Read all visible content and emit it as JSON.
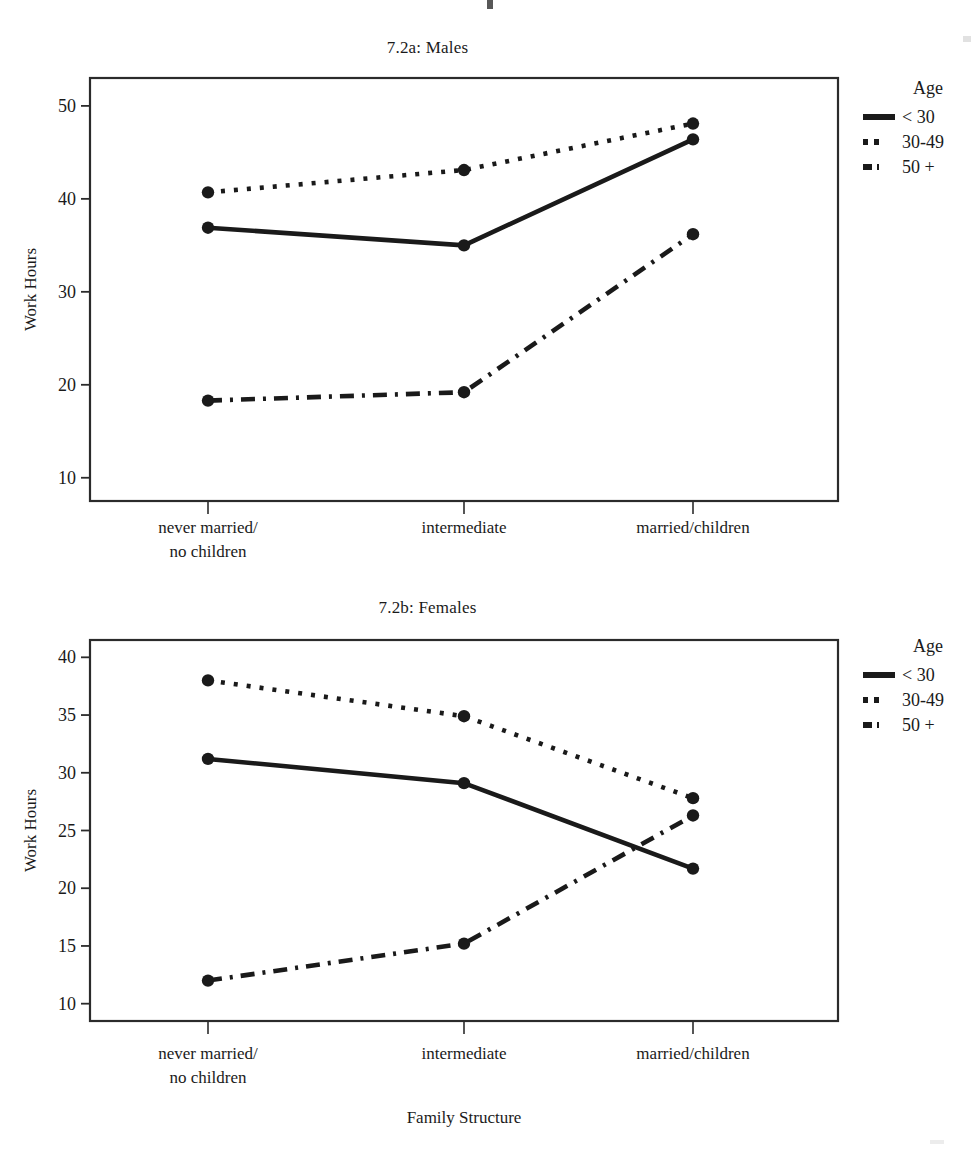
{
  "page": {
    "background": "#ffffff",
    "ink_color": "#1a1a1a",
    "frame_color": "#2b2b2b"
  },
  "figures": [
    {
      "id": "males",
      "title": "7.2a: Males",
      "legend": {
        "title": "Age",
        "entries": [
          {
            "label": "< 30",
            "style": "solid"
          },
          {
            "label": "30-49",
            "style": "dotted"
          },
          {
            "label": "50 +",
            "style": "dashdot"
          }
        ]
      }
    },
    {
      "id": "females",
      "title": "7.2b: Females",
      "legend": {
        "title": "Age",
        "entries": [
          {
            "label": "< 30",
            "style": "solid"
          },
          {
            "label": "30-49",
            "style": "dotted"
          },
          {
            "label": "50 +",
            "style": "dashdot"
          }
        ]
      }
    }
  ],
  "chart_data": [
    {
      "type": "line",
      "title": "7.2a: Males",
      "xlabel": "Family Structure",
      "ylabel": "Work Hours",
      "categories": [
        "never married/\nno children",
        "intermediate",
        "married/children"
      ],
      "category_lines": [
        [
          "never married/",
          "no children"
        ],
        [
          "intermediate"
        ],
        [
          "married/children"
        ]
      ],
      "yticks": [
        10,
        20,
        30,
        40,
        50
      ],
      "ylim": [
        7.5,
        53
      ],
      "grid": false,
      "legend_title": "Age",
      "legend_position": "right",
      "markers": "filled-circle",
      "series": [
        {
          "name": "< 30",
          "style": "solid",
          "values": [
            36.9,
            35.0,
            46.4
          ]
        },
        {
          "name": "30-49",
          "style": "dotted",
          "values": [
            40.7,
            43.1,
            48.1
          ]
        },
        {
          "name": "50 +",
          "style": "dashdot",
          "values": [
            18.3,
            19.2,
            36.2
          ]
        }
      ]
    },
    {
      "type": "line",
      "title": "7.2b: Females",
      "xlabel": "Family Structure",
      "ylabel": "Work Hours",
      "categories": [
        "never married/\nno children",
        "intermediate",
        "married/children"
      ],
      "category_lines": [
        [
          "never married/",
          "no children"
        ],
        [
          "intermediate"
        ],
        [
          "married/children"
        ]
      ],
      "yticks": [
        10,
        15,
        20,
        25,
        30,
        35,
        40
      ],
      "ylim": [
        8.5,
        41.5
      ],
      "grid": false,
      "legend_title": "Age",
      "legend_position": "right",
      "markers": "filled-circle",
      "series": [
        {
          "name": "< 30",
          "style": "solid",
          "values": [
            31.2,
            29.1,
            21.7
          ]
        },
        {
          "name": "30-49",
          "style": "dotted",
          "values": [
            38.0,
            34.9,
            27.8
          ]
        },
        {
          "name": "50 +",
          "style": "dashdot",
          "values": [
            12.0,
            15.2,
            26.3
          ]
        }
      ]
    }
  ]
}
